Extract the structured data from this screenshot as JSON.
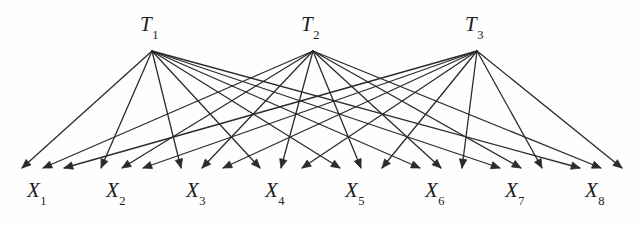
{
  "figure": {
    "background_color": "#fefefe",
    "line_color": "#2b2b2b",
    "text_color": "#1d1d1d",
    "line_width": 1.3
  },
  "latent_nodes": [
    {
      "id": "T1",
      "base": "T",
      "subscript": "1",
      "x": 152,
      "y": 51,
      "label_x": 140,
      "label_y": 14
    },
    {
      "id": "T2",
      "base": "T",
      "subscript": "2",
      "x": 313,
      "y": 51,
      "label_x": 301,
      "label_y": 14
    },
    {
      "id": "T3",
      "base": "T",
      "subscript": "3",
      "x": 477,
      "y": 51,
      "label_x": 465,
      "label_y": 14
    }
  ],
  "observed_nodes": [
    {
      "id": "X1",
      "base": "X",
      "subscript": "1",
      "x": 43,
      "y": 168,
      "label_x": 27,
      "label_y": 180
    },
    {
      "id": "X2",
      "base": "X",
      "subscript": "2",
      "x": 122,
      "y": 168,
      "label_x": 106,
      "label_y": 180
    },
    {
      "id": "X3",
      "base": "X",
      "subscript": "3",
      "x": 202,
      "y": 168,
      "label_x": 186,
      "label_y": 180
    },
    {
      "id": "X4",
      "base": "X",
      "subscript": "4",
      "x": 281,
      "y": 168,
      "label_x": 265,
      "label_y": 180
    },
    {
      "id": "X5",
      "base": "X",
      "subscript": "5",
      "x": 361,
      "y": 168,
      "label_x": 345,
      "label_y": 180
    },
    {
      "id": "X6",
      "base": "X",
      "subscript": "6",
      "x": 441,
      "y": 168,
      "label_x": 425,
      "label_y": 180
    },
    {
      "id": "X7",
      "base": "X",
      "subscript": "7",
      "x": 521,
      "y": 168,
      "label_x": 505,
      "label_y": 180
    },
    {
      "id": "X8",
      "base": "X",
      "subscript": "8",
      "x": 601,
      "y": 168,
      "label_x": 585,
      "label_y": 180
    }
  ],
  "edges": [
    {
      "from": "T1",
      "to": "X1"
    },
    {
      "from": "T1",
      "to": "X2"
    },
    {
      "from": "T1",
      "to": "X3"
    },
    {
      "from": "T1",
      "to": "X4"
    },
    {
      "from": "T1",
      "to": "X5"
    },
    {
      "from": "T1",
      "to": "X6"
    },
    {
      "from": "T1",
      "to": "X7"
    },
    {
      "from": "T1",
      "to": "X8"
    },
    {
      "from": "T2",
      "to": "X1"
    },
    {
      "from": "T2",
      "to": "X2"
    },
    {
      "from": "T2",
      "to": "X3"
    },
    {
      "from": "T2",
      "to": "X4"
    },
    {
      "from": "T2",
      "to": "X5"
    },
    {
      "from": "T2",
      "to": "X6"
    },
    {
      "from": "T2",
      "to": "X7"
    },
    {
      "from": "T2",
      "to": "X8"
    },
    {
      "from": "T3",
      "to": "X1"
    },
    {
      "from": "T3",
      "to": "X2"
    },
    {
      "from": "T3",
      "to": "X3"
    },
    {
      "from": "T3",
      "to": "X4"
    },
    {
      "from": "T3",
      "to": "X5"
    },
    {
      "from": "T3",
      "to": "X6"
    },
    {
      "from": "T3",
      "to": "X7"
    },
    {
      "from": "T3",
      "to": "X8"
    }
  ],
  "arrowhead_offsets": {
    "T1": -21,
    "T2": 0,
    "T3": 21
  }
}
